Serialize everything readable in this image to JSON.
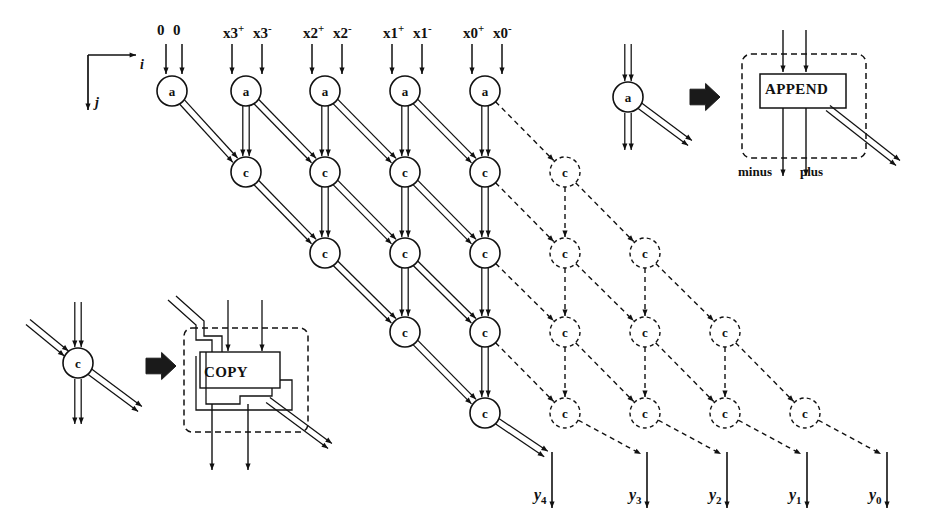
{
  "figure": {
    "kind": "systolic-array-dependence-graph",
    "axes": {
      "i_label": "i",
      "j_label": "j"
    },
    "inputs": [
      {
        "plus": "0",
        "minus": "0",
        "plus_sup": "",
        "minus_sup": "",
        "x": 166,
        "x2": 182
      },
      {
        "plus": "x3",
        "minus": "x3",
        "plus_sup": "+",
        "minus_sup": "-",
        "x": 232,
        "x2": 262
      },
      {
        "plus": "x2",
        "minus": "x2",
        "plus_sup": "+",
        "minus_sup": "-",
        "x": 312,
        "x2": 342
      },
      {
        "plus": "x1",
        "minus": "x1",
        "plus_sup": "+",
        "minus_sup": "-",
        "x": 392,
        "x2": 422
      },
      {
        "plus": "x0",
        "minus": "x0",
        "plus_sup": "+",
        "minus_sup": "-",
        "x": 472,
        "x2": 502
      }
    ],
    "outputs": [
      {
        "label": "y",
        "sub": "4",
        "x": 534
      },
      {
        "label": "y",
        "sub": "3",
        "x": 629
      },
      {
        "label": "y",
        "sub": "2",
        "x": 709
      },
      {
        "label": "y",
        "sub": "1",
        "x": 789
      },
      {
        "label": "y",
        "sub": "0",
        "x": 869
      }
    ],
    "node_labels": {
      "append_node": "a",
      "copy_node": "c"
    },
    "legend_append": {
      "node_label": "a",
      "box_label": "APPEND",
      "out_left_label": "minus",
      "out_right_label": "plus"
    },
    "legend_copy": {
      "node_label": "c",
      "box_label": "COPY"
    },
    "colors": {
      "ink": "#111111",
      "paper": "#ffffff",
      "arrow_block": "#1a1a1a"
    },
    "grid": {
      "row_y": [
        91,
        172,
        253,
        332,
        413
      ],
      "col_x": [
        172,
        246,
        325,
        405,
        485,
        565,
        645,
        725,
        805
      ],
      "solid_rows": [
        {
          "type": "a",
          "cols": [
            0,
            1,
            2,
            3,
            4
          ]
        },
        {
          "type": "c",
          "cols": [
            1,
            2,
            3,
            4
          ]
        },
        {
          "type": "c",
          "cols": [
            2,
            3,
            4
          ]
        },
        {
          "type": "c",
          "cols": [
            3,
            4
          ]
        },
        {
          "type": "c",
          "cols": [
            4
          ]
        }
      ],
      "dashed_rows": [
        {
          "type": "c",
          "cols": [
            5
          ]
        },
        {
          "type": "c",
          "cols": [
            5,
            6
          ]
        },
        {
          "type": "c",
          "cols": [
            5,
            6,
            7
          ]
        },
        {
          "type": "c",
          "cols": [
            5,
            6,
            7,
            8
          ]
        }
      ]
    }
  }
}
